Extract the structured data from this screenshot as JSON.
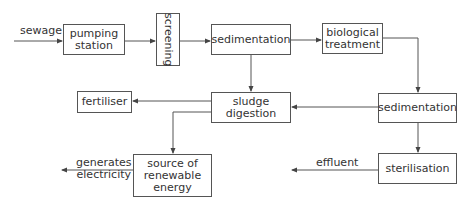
{
  "diagram": {
    "type": "flowchart",
    "nodes": {
      "pumping_station": "pumping\nstation",
      "screening": "screening",
      "sedimentation_1": "sedimentation",
      "biological_treatment": "biological\ntreatment",
      "sedimentation_2": "sedimentation",
      "sludge_digestion": "sludge\ndigestion",
      "fertiliser": "fertiliser",
      "renewable_energy": "source of\nrenewable\nenergy",
      "sterilisation": "sterilisation"
    },
    "labels": {
      "sewage": "sewage",
      "generates_electricity": "generates\nelectricity",
      "effluent": "effluent"
    },
    "edges": [
      {
        "from": "sewage",
        "to": "pumping station"
      },
      {
        "from": "pumping station",
        "to": "screening"
      },
      {
        "from": "screening",
        "to": "sedimentation"
      },
      {
        "from": "sedimentation",
        "to": "biological treatment"
      },
      {
        "from": "sedimentation",
        "to": "sludge digestion"
      },
      {
        "from": "biological treatment",
        "to": "sedimentation (2)"
      },
      {
        "from": "sedimentation (2)",
        "to": "sludge digestion"
      },
      {
        "from": "sedimentation (2)",
        "to": "sterilisation"
      },
      {
        "from": "sludge digestion",
        "to": "fertiliser"
      },
      {
        "from": "sludge digestion",
        "to": "source of renewable energy"
      },
      {
        "from": "source of renewable energy",
        "to": "generates electricity"
      },
      {
        "from": "sterilisation",
        "to": "effluent"
      }
    ]
  }
}
